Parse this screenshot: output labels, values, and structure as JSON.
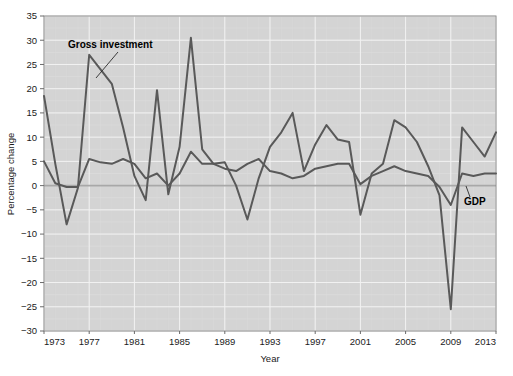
{
  "chart_data": {
    "type": "line",
    "title": "",
    "xlabel": "Year",
    "ylabel": "Percentage change",
    "xlim": [
      1973,
      2013
    ],
    "ylim": [
      -30,
      35
    ],
    "grid": true,
    "legend_position": "inline-annotations",
    "xticks": [
      "1973",
      "1977",
      "1981",
      "1985",
      "1989",
      "1993",
      "1997",
      "2001",
      "2005",
      "2009",
      "2013"
    ],
    "yticks": [
      "35",
      "30",
      "25",
      "20",
      "15",
      "10",
      "5",
      "0",
      "-5",
      "-10",
      "-15",
      "-20",
      "-25",
      "-30"
    ],
    "x": [
      1973,
      1974,
      1975,
      1976,
      1977,
      1978,
      1979,
      1980,
      1981,
      1982,
      1983,
      1984,
      1985,
      1986,
      1987,
      1988,
      1989,
      1990,
      1991,
      1992,
      1993,
      1994,
      1995,
      1996,
      1997,
      1998,
      1999,
      2000,
      2001,
      2002,
      2003,
      2004,
      2005,
      2006,
      2007,
      2008,
      2009,
      2010,
      2011,
      2012,
      2013
    ],
    "series": [
      {
        "name": "Gross investment",
        "label": "Gross investment",
        "color": "#595959",
        "values": [
          18.5,
          4.5,
          -8.0,
          -0.5,
          27.0,
          24.0,
          21.0,
          12.0,
          2.0,
          -3.0,
          19.7,
          -1.8,
          8.0,
          30.5,
          7.5,
          4.5,
          4.8,
          0.0,
          -7.0,
          1.5,
          8.0,
          11.0,
          15.0,
          3.0,
          8.5,
          12.5,
          9.5,
          9.0,
          -6.0,
          2.5,
          4.5,
          13.5,
          12.0,
          9.0,
          4.0,
          -2.0,
          -25.5,
          12.0,
          9.0,
          6.0,
          11.0
        ]
      },
      {
        "name": "GDP",
        "label": "GDP",
        "color": "#595959",
        "values": [
          5.0,
          0.5,
          -0.3,
          -0.3,
          5.5,
          4.8,
          4.5,
          5.5,
          4.5,
          1.5,
          2.5,
          0.0,
          2.5,
          7.0,
          4.5,
          4.5,
          3.5,
          3.0,
          4.5,
          5.5,
          3.0,
          2.5,
          1.5,
          2.0,
          3.5,
          4.0,
          4.5,
          4.5,
          0.3,
          2.0,
          3.0,
          4.0,
          3.0,
          2.5,
          2.0,
          -0.3,
          -4.0,
          2.5,
          2.0,
          2.5,
          2.5
        ]
      }
    ],
    "annotations": [
      {
        "text": "Gross investment",
        "anchor_year": 1978
      },
      {
        "text": "GDP",
        "anchor_year": 2011
      }
    ],
    "colors": {
      "plot_background": "#d4d4d4",
      "gridline": "#f0f0f0",
      "zero_line": "#a8a8a8",
      "axis": "#6b6b6b",
      "line": "#595959",
      "text": "#1b1b1b"
    }
  }
}
